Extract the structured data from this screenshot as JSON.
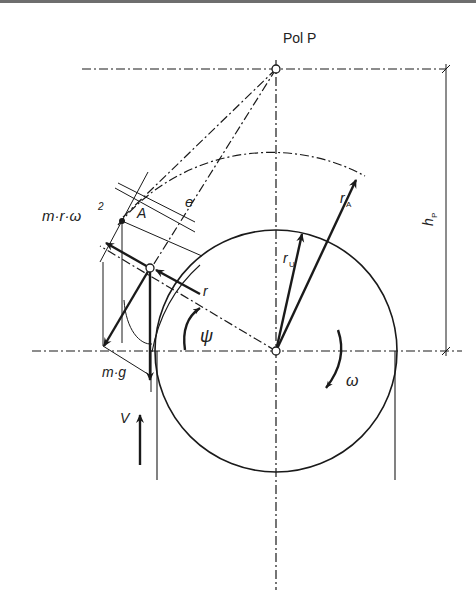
{
  "diagram": {
    "pole_label": "Pol P",
    "labels": {
      "centrifugal_force": "m·r·ω",
      "centrifugal_exp": "2",
      "point_a": "A",
      "eccentricity": "e",
      "radius_r": "r",
      "radius_a": "r",
      "radius_a_sub": "A",
      "radius_u": "r",
      "radius_u_sub": "U",
      "angle": "ψ",
      "weight": "m·g",
      "velocity": "V",
      "angular_velocity": "ω",
      "pole_height": "h",
      "pole_height_sub": "P"
    },
    "colors": {
      "line": "#1a1a1a",
      "top_border": "#6e6e6e"
    }
  }
}
